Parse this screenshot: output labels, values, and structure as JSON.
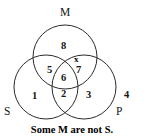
{
  "figure": {
    "type": "venn-diagram-3-set",
    "caption": "Some M are not S.",
    "stroke_color": "#2b2b2b",
    "text_color": "#141414",
    "background": "#ffffff"
  },
  "sets": [
    {
      "id": "M",
      "label": "M",
      "position": "top",
      "label_x": 60,
      "label_y": 7,
      "cx": 65,
      "cy": 57,
      "r": 32
    },
    {
      "id": "S",
      "label": "S",
      "position": "bottom-left",
      "label_x": 4,
      "label_y": 106,
      "cx": 46,
      "cy": 87,
      "r": 32
    },
    {
      "id": "P",
      "label": "P",
      "position": "bottom-right",
      "label_x": 116,
      "label_y": 106,
      "cx": 84,
      "cy": 87,
      "r": 32
    }
  ],
  "regions": [
    {
      "number": "1",
      "meaning": "S only",
      "x": 32,
      "y": 91
    },
    {
      "number": "2",
      "meaning": "S and P only",
      "x": 61,
      "y": 89
    },
    {
      "number": "3",
      "meaning": "P only",
      "x": 86,
      "y": 90
    },
    {
      "number": "4",
      "meaning": "outside all",
      "x": 124,
      "y": 90
    },
    {
      "number": "5",
      "meaning": "S and M only",
      "x": 47,
      "y": 65
    },
    {
      "number": "6",
      "meaning": "S and M and P",
      "x": 61,
      "y": 73
    },
    {
      "number": "7",
      "meaning": "M and P only",
      "x": 76,
      "y": 65
    },
    {
      "number": "8",
      "meaning": "M only",
      "x": 61,
      "y": 41
    }
  ],
  "marks": [
    {
      "symbol": "x",
      "region": "7",
      "meaning": "member exists in M and P but not S",
      "x": 74,
      "y": 55
    }
  ]
}
